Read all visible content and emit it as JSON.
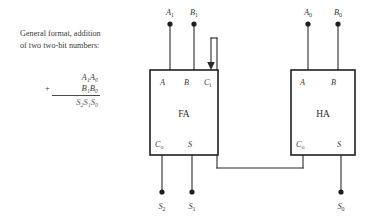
{
  "caption": {
    "line1": "General format, addition",
    "line2": "of two two-bit numbers:"
  },
  "formula": {
    "augend": "A₁A₀",
    "plus_sign": "+",
    "addend": "B₁B₀",
    "sum": "S₂S₁S₀"
  },
  "blocks": [
    {
      "id": "full-adder",
      "name": "FA",
      "inputs": [
        {
          "name": "A",
          "label": "A"
        },
        {
          "name": "B",
          "label": "B"
        },
        {
          "name": "Ci",
          "label": "C",
          "sub": "i"
        }
      ],
      "outputs": [
        {
          "name": "Co",
          "label": "C",
          "sub": "o"
        },
        {
          "name": "S",
          "label": "S"
        }
      ]
    },
    {
      "id": "half-adder",
      "name": "HA",
      "inputs": [
        {
          "name": "A",
          "label": "A"
        },
        {
          "name": "B",
          "label": "B"
        }
      ],
      "outputs": [
        {
          "name": "Co",
          "label": "C",
          "sub": "o"
        },
        {
          "name": "S",
          "label": "S"
        }
      ]
    }
  ],
  "terminals": {
    "inputs": [
      {
        "name": "A1",
        "base": "A",
        "sub": "1"
      },
      {
        "name": "B1",
        "base": "B",
        "sub": "1"
      },
      {
        "name": "A0",
        "base": "A",
        "sub": "0"
      },
      {
        "name": "B0",
        "base": "B",
        "sub": "0"
      }
    ],
    "outputs": [
      {
        "name": "S2",
        "base": "S",
        "sub": "2"
      },
      {
        "name": "S1",
        "base": "S",
        "sub": "1"
      },
      {
        "name": "S0",
        "base": "S",
        "sub": "0"
      }
    ]
  },
  "colors": {
    "background": "#ffffff",
    "wire": "#2b2b2b",
    "box_border": "#1f1f1f",
    "text": "#3a3a3a"
  }
}
